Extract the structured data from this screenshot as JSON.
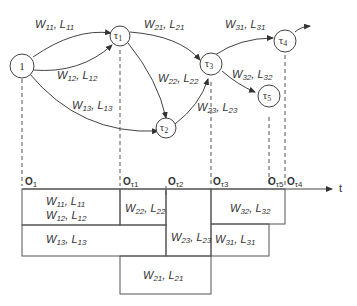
{
  "diagram": {
    "nodes": [
      {
        "id": "n1",
        "label": "1",
        "sub": ""
      },
      {
        "id": "tau1",
        "label": "τ",
        "sub": "1"
      },
      {
        "id": "tau2",
        "label": "τ",
        "sub": "2"
      },
      {
        "id": "tau3",
        "label": "τ",
        "sub": "3"
      },
      {
        "id": "tau4",
        "label": "τ",
        "sub": "4"
      },
      {
        "id": "tau5",
        "label": "τ",
        "sub": "5"
      }
    ],
    "edges": [
      {
        "from": "1",
        "to": "τ1",
        "w": "W",
        "wsub": "11",
        "l": "L",
        "lsub": "11"
      },
      {
        "from": "1",
        "to": "τ1",
        "w": "W",
        "wsub": "12",
        "l": "L",
        "lsub": "12"
      },
      {
        "from": "1",
        "to": "τ2",
        "w": "W",
        "wsub": "13",
        "l": "L",
        "lsub": "13"
      },
      {
        "from": "τ1",
        "to": "τ3",
        "w": "W",
        "wsub": "21",
        "l": "L",
        "lsub": "21"
      },
      {
        "from": "τ1",
        "to": "τ2",
        "w": "W",
        "wsub": "22",
        "l": "L",
        "lsub": "22"
      },
      {
        "from": "τ2",
        "to": "τ3",
        "w": "W",
        "wsub": "23",
        "l": "L",
        "lsub": "23"
      },
      {
        "from": "τ3",
        "to": "τ4",
        "w": "W",
        "wsub": "31",
        "l": "L",
        "lsub": "31"
      },
      {
        "from": "τ3",
        "to": "τ5",
        "w": "W",
        "wsub": "32",
        "l": "L",
        "lsub": "32"
      }
    ],
    "axis": {
      "label": "t",
      "ticks": [
        {
          "o": "O",
          "sub": "1"
        },
        {
          "o": "O",
          "sub": "τ1"
        },
        {
          "o": "O",
          "sub": "τ2"
        },
        {
          "o": "O",
          "sub": "τ3"
        },
        {
          "o": "O",
          "sub": "τ5"
        },
        {
          "o": "O",
          "sub": "τ4"
        }
      ]
    },
    "blocks": [
      {
        "w": "W",
        "wsub": "11",
        "l": "L",
        "lsub": "11"
      },
      {
        "w": "W",
        "wsub": "12",
        "l": "L",
        "lsub": "12"
      },
      {
        "w": "W",
        "wsub": "22",
        "l": "L",
        "lsub": "22"
      },
      {
        "w": "W",
        "wsub": "13",
        "l": "L",
        "lsub": "13"
      },
      {
        "w": "W",
        "wsub": "23",
        "l": "L",
        "lsub": "23"
      },
      {
        "w": "W",
        "wsub": "21",
        "l": "L",
        "lsub": "21"
      },
      {
        "w": "W",
        "wsub": "32",
        "l": "L",
        "lsub": "32"
      },
      {
        "w": "W",
        "wsub": "31",
        "l": "L",
        "lsub": "31"
      }
    ]
  }
}
